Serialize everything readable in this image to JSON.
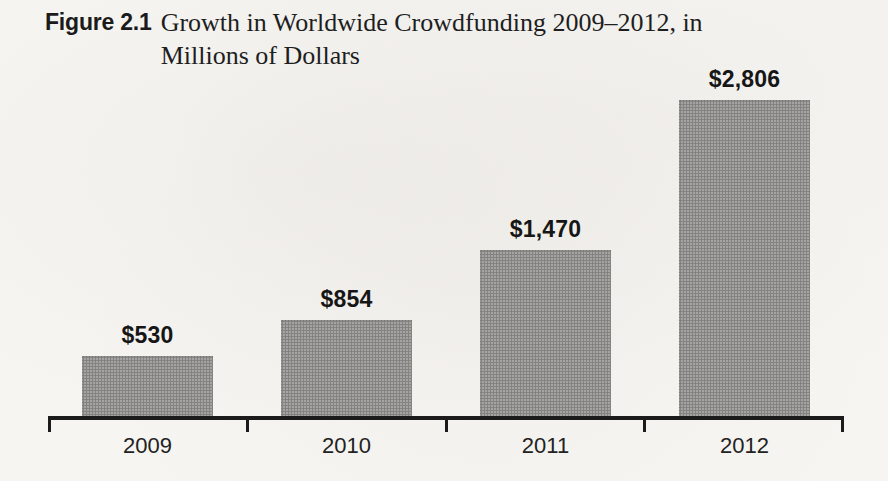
{
  "figure": {
    "label": "Figure 2.1",
    "caption_line1": "Growth in Worldwide Crowdfunding 2009–2012, in",
    "caption_line2": "Millions of Dollars"
  },
  "chart_data": {
    "type": "bar",
    "figure_number": "Figure 2.1",
    "title": "Growth in Worldwide Crowdfunding 2009–2012, in Millions of Dollars",
    "unit": "Millions of Dollars",
    "categories": [
      "2009",
      "2010",
      "2011",
      "2012"
    ],
    "values": [
      530,
      854,
      1470,
      2806
    ],
    "value_labels": [
      "$530",
      "$854",
      "$1,470",
      "$2,806"
    ],
    "xlabel": "",
    "ylabel": "",
    "ylim": [
      0,
      2806
    ],
    "grid": false,
    "legend": false,
    "colors": {
      "bar": "#a9a8a6",
      "axis": "#1b1b1b",
      "text": "#1d1d1d",
      "background": "#f6f5f2"
    }
  }
}
